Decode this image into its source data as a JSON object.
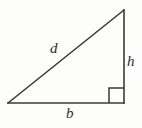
{
  "figure": {
    "type": "right-triangle-diagram",
    "background_color": "#fdfdfc",
    "stroke_color": "#3a3a3a",
    "labels": {
      "hypotenuse": "d",
      "vertical_leg": "h",
      "horizontal_leg": "b"
    },
    "right_angle_marker": {
      "name": "right-angle-square",
      "vertex": "bottom-right"
    },
    "geometry": {
      "left_vertex": [
        8,
        103
      ],
      "top_vertex": [
        124,
        10
      ],
      "right_vertex": [
        124,
        103
      ],
      "marker_size": 15
    }
  }
}
